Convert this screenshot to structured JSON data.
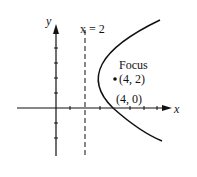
{
  "figure": {
    "axes": {
      "x_label": "x",
      "y_label": "y"
    },
    "directrix": {
      "label": "x = 2",
      "x": 2,
      "style": "dashed"
    },
    "focus": {
      "label": "Focus",
      "coords": "(4, 2)",
      "x": 4,
      "y": 2
    },
    "vertex_label": "(4, 0)",
    "curve": {
      "type": "parabola",
      "opens": "right",
      "color": "#111111"
    },
    "ticks": {
      "x": [
        1,
        2,
        3,
        4,
        5,
        6,
        7
      ],
      "y": [
        -2,
        -1,
        1,
        2,
        3,
        4
      ]
    }
  }
}
